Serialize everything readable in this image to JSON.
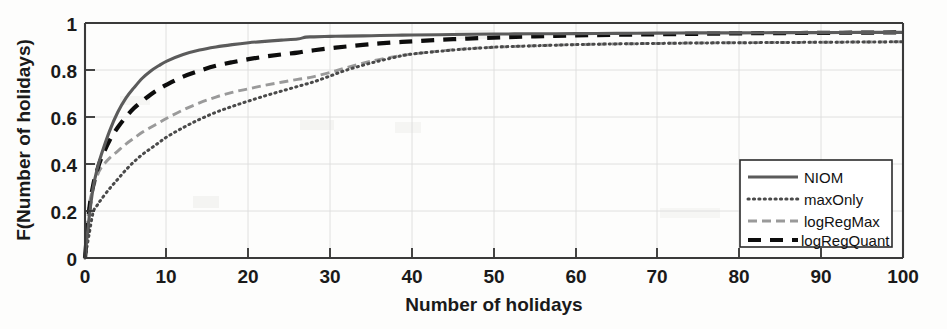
{
  "chart_data": {
    "type": "line",
    "title": "",
    "xlabel": "Number of holidays",
    "ylabel": "F(Number of holidays)",
    "xlim": [
      0,
      100
    ],
    "ylim": [
      0,
      1
    ],
    "xticks": [
      0,
      10,
      20,
      30,
      40,
      50,
      60,
      70,
      80,
      90,
      100
    ],
    "xticklabels": [
      "0",
      "10",
      "20",
      "30",
      "40",
      "50",
      "60",
      "70",
      "80",
      "90",
      "100"
    ],
    "yticks": [
      0,
      0.2,
      0.4,
      0.6,
      0.8,
      1
    ],
    "yticklabels": [
      "0",
      "0.2",
      "0.4",
      "0.6",
      "0.8",
      "1"
    ],
    "grid": true,
    "legend_position": "lower-right-inside",
    "x": [
      0,
      0.5,
      1,
      1.5,
      2,
      3,
      4,
      5,
      6,
      7,
      8,
      9,
      10,
      12,
      14,
      16,
      18,
      20,
      22,
      24,
      26,
      27,
      28,
      30,
      32,
      35,
      38,
      40,
      45,
      50,
      55,
      60,
      65,
      70,
      75,
      80,
      85,
      90,
      95,
      100
    ],
    "series": [
      {
        "name": "NIOM",
        "style": "solid",
        "color": "#5b5b5b",
        "values": [
          0.0,
          0.17,
          0.3,
          0.38,
          0.44,
          0.54,
          0.62,
          0.68,
          0.725,
          0.765,
          0.795,
          0.818,
          0.838,
          0.866,
          0.885,
          0.898,
          0.908,
          0.916,
          0.922,
          0.927,
          0.932,
          0.94,
          0.941,
          0.943,
          0.944,
          0.946,
          0.948,
          0.949,
          0.951,
          0.953,
          0.954,
          0.955,
          0.956,
          0.957,
          0.958,
          0.958,
          0.959,
          0.959,
          0.96,
          0.96
        ]
      },
      {
        "name": "maxOnly",
        "style": "dotted",
        "color": "#4a4a4a",
        "values": [
          0.0,
          0.1,
          0.195,
          0.225,
          0.25,
          0.295,
          0.335,
          0.375,
          0.41,
          0.44,
          0.465,
          0.49,
          0.515,
          0.555,
          0.59,
          0.62,
          0.645,
          0.668,
          0.69,
          0.71,
          0.73,
          0.74,
          0.75,
          0.775,
          0.8,
          0.83,
          0.855,
          0.868,
          0.885,
          0.897,
          0.903,
          0.908,
          0.911,
          0.913,
          0.915,
          0.916,
          0.917,
          0.918,
          0.919,
          0.92
        ]
      },
      {
        "name": "logRegMax",
        "style": "dashed-gray",
        "color": "#9a9a9a",
        "values": [
          0.0,
          0.22,
          0.295,
          0.35,
          0.385,
          0.425,
          0.455,
          0.485,
          0.51,
          0.535,
          0.555,
          0.575,
          0.595,
          0.63,
          0.66,
          0.685,
          0.705,
          0.72,
          0.735,
          0.748,
          0.76,
          0.765,
          0.772,
          0.79,
          0.81,
          0.838,
          0.858,
          0.868,
          0.886,
          0.897,
          0.903,
          0.908,
          0.911,
          0.913,
          0.915,
          0.916,
          0.917,
          0.918,
          0.919,
          0.92
        ]
      },
      {
        "name": "logRegQuant",
        "style": "dashed-black-bold",
        "color": "#0d0d0d",
        "values": [
          0.0,
          0.2,
          0.31,
          0.375,
          0.425,
          0.5,
          0.555,
          0.6,
          0.638,
          0.668,
          0.695,
          0.718,
          0.738,
          0.772,
          0.797,
          0.818,
          0.833,
          0.846,
          0.857,
          0.866,
          0.874,
          0.88,
          0.884,
          0.893,
          0.9,
          0.91,
          0.918,
          0.922,
          0.931,
          0.938,
          0.943,
          0.947,
          0.95,
          0.952,
          0.954,
          0.956,
          0.957,
          0.958,
          0.959,
          0.96
        ]
      }
    ],
    "legend": [
      {
        "label": "NIOM",
        "style": "solid"
      },
      {
        "label": "maxOnly",
        "style": "dotted"
      },
      {
        "label": "logRegMax",
        "style": "dashed-gray"
      },
      {
        "label": "logRegQuant",
        "style": "dashed-black-bold"
      }
    ]
  }
}
